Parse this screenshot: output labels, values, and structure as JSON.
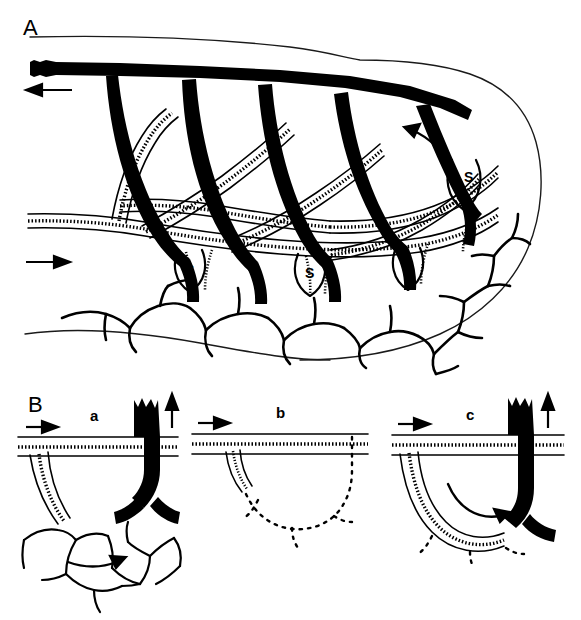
{
  "figure": {
    "background_color": "#ffffff",
    "ink_color": "#000000",
    "width": 581,
    "height": 620
  },
  "panels": [
    {
      "id": "A",
      "letter": "A",
      "description": "Overview of the vascular bed showing the collecting venous trunk, arterial supply with smooth-muscle hatching, arcading arches, sinusoidal widenings and the terminal capillary network",
      "labels": {
        "sinus": "S",
        "sinus_count": 4
      },
      "arrows": [
        {
          "name": "venous-outflow-arrow",
          "direction": "left",
          "meaning": "venous outflow"
        },
        {
          "name": "arterial-inflow-arrow",
          "direction": "right",
          "meaning": "arterial inflow"
        },
        {
          "name": "venous-flow-curved-arrow",
          "direction": "counter-clockwise",
          "meaning": "flow toward the collecting vein"
        }
      ]
    },
    {
      "id": "B",
      "letter": "B",
      "description": "Three sequential stages of a single vascular loop",
      "subpanels": [
        {
          "letter": "a",
          "name": "subpanel-a",
          "description": "Hatched arterial limb and solid black venous limb joined by a capillary network",
          "arrows": [
            {
              "name": "inflow-arrow",
              "direction": "right"
            },
            {
              "name": "outflow-arrow",
              "direction": "up"
            },
            {
              "name": "capillary-flow-arrow",
              "direction": "right"
            }
          ]
        },
        {
          "letter": "b",
          "name": "subpanel-b",
          "description": "Regressed loop: only a short arterial stump remains, the former loop indicated by a dotted outline",
          "arrows": [
            {
              "name": "inflow-arrow",
              "direction": "right"
            }
          ]
        },
        {
          "letter": "c",
          "name": "subpanel-c",
          "description": "Re-formed continuous loop: hatched arterial channel runs directly into the black venous limb",
          "arrows": [
            {
              "name": "inflow-arrow",
              "direction": "right"
            },
            {
              "name": "outflow-arrow",
              "direction": "up"
            },
            {
              "name": "loop-flow-arrow",
              "direction": "clockwise"
            }
          ]
        }
      ]
    }
  ],
  "legend": {
    "hatched_vessel": "artery / arteriole with smooth muscle",
    "solid_black_vessel": "vein / venule",
    "outline_vessel": "capillary network",
    "S": "sinus"
  }
}
